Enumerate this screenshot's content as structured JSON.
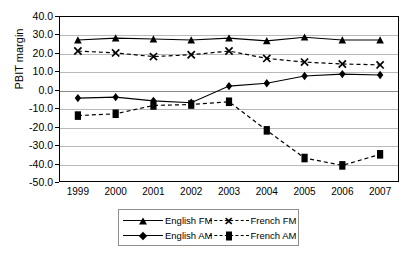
{
  "chart_data": {
    "type": "line",
    "title": "",
    "xlabel": "",
    "ylabel": "PBIT margin",
    "categories": [
      "1999",
      "2000",
      "2001",
      "2002",
      "2003",
      "2004",
      "2005",
      "2006",
      "2007"
    ],
    "ylim": [
      -50.0,
      40.0
    ],
    "ytick_values": [
      40.0,
      30.0,
      20.0,
      10.0,
      0.0,
      -10.0,
      -20.0,
      -30.0,
      -40.0,
      -50.0
    ],
    "ytick_labels": [
      "40.0",
      "30.0",
      "20.0",
      "10.0",
      "0.0",
      "-10.0",
      "-20.0",
      "-30.0",
      "-40.0",
      "-50.0"
    ],
    "grid": true,
    "legend_position": "bottom",
    "series": [
      {
        "name": "English FM",
        "marker": "triangle",
        "linestyle": "solid",
        "color": "#000000",
        "values": [
          27.0,
          28.0,
          27.5,
          27.0,
          28.0,
          26.5,
          28.5,
          27.0,
          27.0
        ]
      },
      {
        "name": "French FM",
        "marker": "x",
        "linestyle": "dashed",
        "color": "#000000",
        "values": [
          21.0,
          20.0,
          18.0,
          19.0,
          21.0,
          17.0,
          15.0,
          14.0,
          13.5
        ]
      },
      {
        "name": "English AM",
        "marker": "diamond",
        "linestyle": "solid",
        "color": "#000000",
        "values": [
          -4.5,
          -4.0,
          -6.0,
          -7.0,
          2.0,
          3.5,
          7.5,
          8.5,
          8.0
        ]
      },
      {
        "name": "French AM",
        "marker": "square",
        "linestyle": "dashed",
        "color": "#000000",
        "values": [
          -14.0,
          -13.0,
          -8.5,
          -8.0,
          -6.5,
          -22.0,
          -37.0,
          -41.0,
          -35.0
        ]
      }
    ]
  },
  "legend": {
    "entries": [
      {
        "label": "English FM"
      },
      {
        "label": "French FM"
      },
      {
        "label": "English AM"
      },
      {
        "label": "French AM"
      }
    ]
  }
}
